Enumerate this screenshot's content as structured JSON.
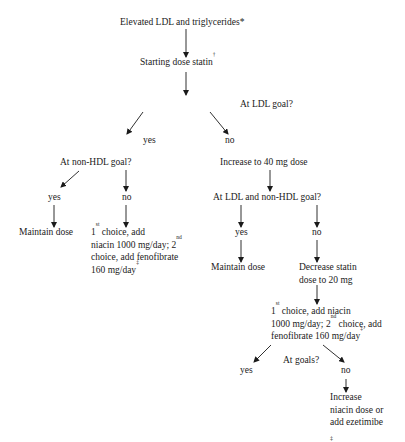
{
  "flowchart": {
    "start": {
      "text": "Elevated LDL and triglycerides",
      "sup": "*"
    },
    "step1": {
      "text": "Starting dose statin",
      "sup": "†"
    },
    "q_ldl_goal": "At LDL goal?",
    "ldl_yes": "yes",
    "ldl_no": "no",
    "left_branch": {
      "q_nonhdl_goal": "At non-HDL goal?",
      "yes": "yes",
      "no": "no",
      "yes_action": "Maintain dose",
      "no_action": {
        "line1_pre": "1",
        "line1_sup": "st",
        "line1_post": " choice, add",
        "line2_pre": "niacin 1000 mg/day; 2",
        "line2_sup": "nd",
        "line3": "choice, add fenofibrate",
        "line4_pre": "160 mg/day",
        "line4_sup": "‡"
      }
    },
    "right_branch": {
      "increase": "Increase to 40 mg dose",
      "q_both_goals": "At LDL and non-HDL goal?",
      "yes": "yes",
      "no": "no",
      "yes_action": "Maintain dose",
      "no_action_line1": "Decrease statin",
      "no_action_line2": "dose to 20 mg",
      "add_therapy": {
        "line1_pre": "1",
        "line1_sup": "st",
        "line1_post": " choice, add niacin",
        "line2_pre": "1000 mg/day; 2",
        "line2_sup": "nd",
        "line2_post": " choice, add",
        "line3_pre": "fenofibrate 160 mg/day",
        "line3_sup": "‡"
      },
      "q_at_goals": "At goals?",
      "goals_yes": "yes",
      "goals_no": "no",
      "final_action_line1": "Increase",
      "final_action_line2": "niacin dose or",
      "final_action_line3": "add ezetimibe"
    },
    "footnote_mark": "‡"
  }
}
